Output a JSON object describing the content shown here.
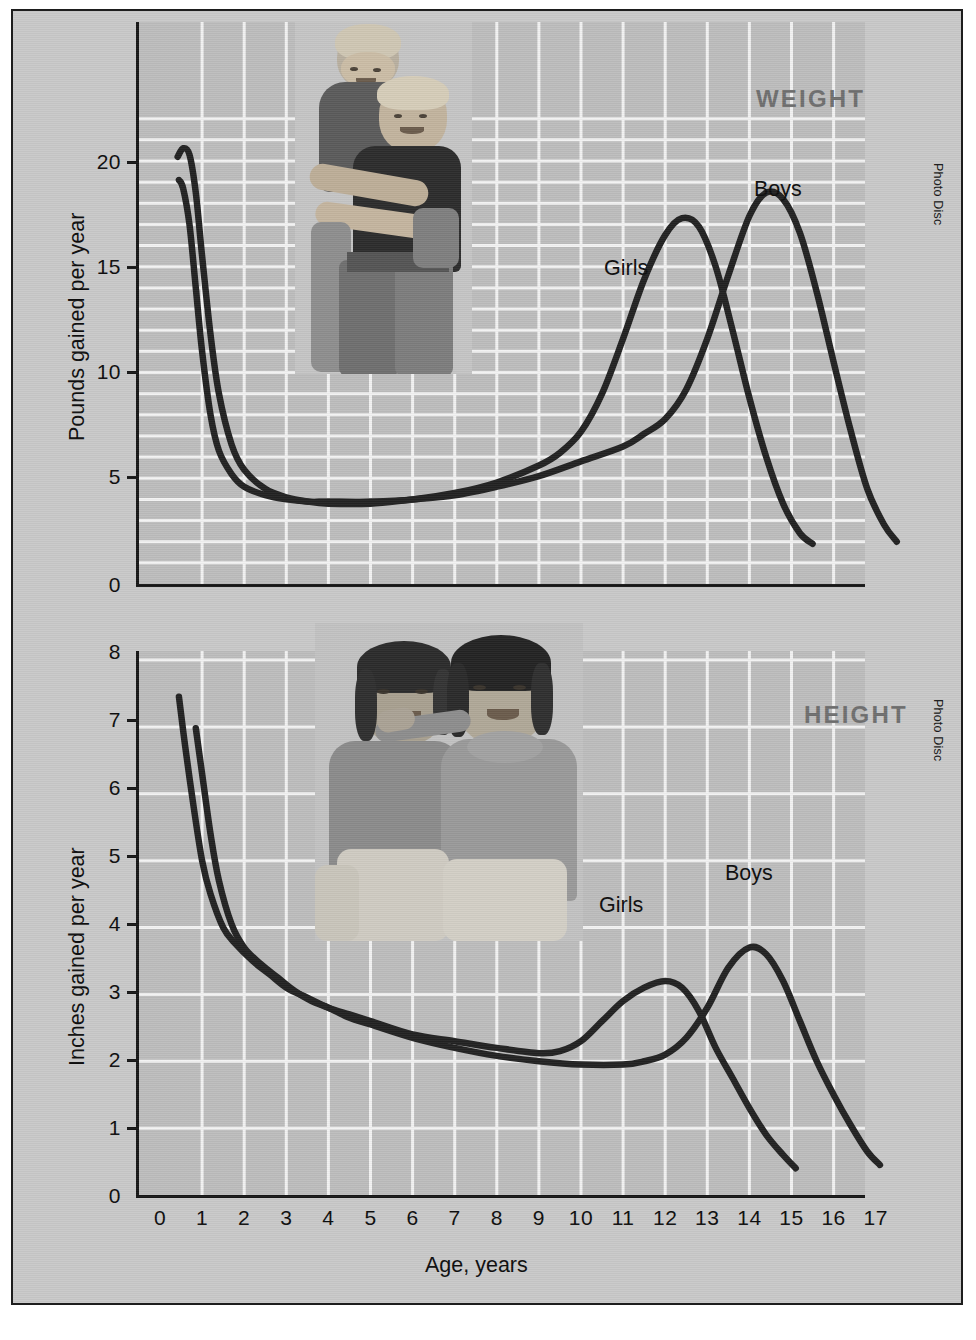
{
  "figure": {
    "background_color": "#c9c9c9",
    "plot_background_color": "#bdbdbd",
    "grid_color": "#f2f2f2",
    "curve_color": "#222222",
    "title_color": "#6f6f6f",
    "credit_weight": "Photo Disc",
    "credit_height": "Photo Disc"
  },
  "chart_data": [
    {
      "type": "line",
      "title": "WEIGHT",
      "xlabel": "Age, years",
      "ylabel": "Pounds gained per year",
      "xlim": [
        0,
        18
      ],
      "ylim": [
        0,
        23
      ],
      "xticks": [
        "0",
        "1",
        "2",
        "3",
        "4",
        "5",
        "6",
        "7",
        "8",
        "9",
        "10",
        "11",
        "12",
        "13",
        "14",
        "15",
        "16",
        "17"
      ],
      "yticks": [
        "0",
        "5",
        "10",
        "15",
        "20"
      ],
      "grid": true,
      "legend_position": "inline-annotation",
      "series": [
        {
          "name": "Girls",
          "label_x": 11.1,
          "label_y": 16.2,
          "points": [
            [
              0.45,
              19.1
            ],
            [
              0.55,
              18.7
            ],
            [
              0.7,
              17.0
            ],
            [
              0.85,
              14.0
            ],
            [
              1.0,
              11.0
            ],
            [
              1.2,
              8.0
            ],
            [
              1.4,
              6.3
            ],
            [
              1.7,
              5.2
            ],
            [
              2.0,
              4.6
            ],
            [
              2.5,
              4.2
            ],
            [
              3.0,
              4.0
            ],
            [
              3.5,
              3.9
            ],
            [
              4.0,
              3.9
            ],
            [
              5.0,
              3.9
            ],
            [
              6.0,
              4.0
            ],
            [
              7.0,
              4.3
            ],
            [
              8.0,
              4.8
            ],
            [
              9.0,
              5.6
            ],
            [
              9.5,
              6.2
            ],
            [
              10.0,
              7.2
            ],
            [
              10.5,
              9.0
            ],
            [
              11.0,
              11.6
            ],
            [
              11.5,
              14.4
            ],
            [
              12.0,
              16.5
            ],
            [
              12.4,
              17.3
            ],
            [
              12.8,
              16.9
            ],
            [
              13.2,
              15.0
            ],
            [
              13.6,
              12.0
            ],
            [
              14.0,
              8.8
            ],
            [
              14.4,
              6.0
            ],
            [
              14.8,
              3.8
            ],
            [
              15.2,
              2.4
            ],
            [
              15.5,
              1.9
            ]
          ]
        },
        {
          "name": "Boys",
          "label_x": 14.4,
          "label_y": 19.4,
          "points": [
            [
              0.42,
              20.2
            ],
            [
              0.55,
              20.6
            ],
            [
              0.7,
              20.3
            ],
            [
              0.85,
              18.5
            ],
            [
              1.0,
              15.5
            ],
            [
              1.2,
              11.8
            ],
            [
              1.4,
              9.0
            ],
            [
              1.7,
              6.6
            ],
            [
              2.0,
              5.4
            ],
            [
              2.5,
              4.5
            ],
            [
              3.0,
              4.1
            ],
            [
              3.5,
              3.9
            ],
            [
              4.0,
              3.8
            ],
            [
              5.0,
              3.8
            ],
            [
              6.0,
              4.0
            ],
            [
              7.0,
              4.2
            ],
            [
              8.0,
              4.6
            ],
            [
              9.0,
              5.1
            ],
            [
              10.0,
              5.8
            ],
            [
              11.0,
              6.5
            ],
            [
              11.5,
              7.1
            ],
            [
              12.0,
              7.8
            ],
            [
              12.5,
              9.2
            ],
            [
              13.0,
              11.6
            ],
            [
              13.5,
              14.6
            ],
            [
              14.0,
              17.4
            ],
            [
              14.4,
              18.5
            ],
            [
              14.8,
              18.2
            ],
            [
              15.2,
              16.6
            ],
            [
              15.6,
              13.8
            ],
            [
              16.0,
              10.5
            ],
            [
              16.4,
              7.3
            ],
            [
              16.8,
              4.5
            ],
            [
              17.2,
              2.8
            ],
            [
              17.5,
              2.0
            ]
          ]
        }
      ]
    },
    {
      "type": "line",
      "title": "HEIGHT",
      "xlabel": "Age, years",
      "ylabel": "Inches gained per year",
      "xlim": [
        0,
        18
      ],
      "ylim": [
        0,
        8
      ],
      "xticks": [
        "0",
        "1",
        "2",
        "3",
        "4",
        "5",
        "6",
        "7",
        "8",
        "9",
        "10",
        "11",
        "12",
        "13",
        "14",
        "15",
        "16",
        "17"
      ],
      "yticks": [
        "0",
        "1",
        "2",
        "3",
        "4",
        "5",
        "6",
        "7",
        "8"
      ],
      "grid": true,
      "legend_position": "inline-annotation",
      "series": [
        {
          "name": "Girls",
          "label_x": 11.0,
          "label_y": 3.72,
          "points": [
            [
              0.45,
              7.45
            ],
            [
              0.6,
              6.7
            ],
            [
              0.8,
              5.8
            ],
            [
              1.0,
              5.0
            ],
            [
              1.2,
              4.5
            ],
            [
              1.5,
              4.0
            ],
            [
              1.8,
              3.75
            ],
            [
              2.2,
              3.5
            ],
            [
              2.6,
              3.3
            ],
            [
              3.0,
              3.1
            ],
            [
              3.5,
              2.95
            ],
            [
              4.0,
              2.8
            ],
            [
              4.5,
              2.7
            ],
            [
              5.0,
              2.6
            ],
            [
              6.0,
              2.4
            ],
            [
              7.0,
              2.3
            ],
            [
              8.0,
              2.2
            ],
            [
              9.0,
              2.12
            ],
            [
              9.5,
              2.15
            ],
            [
              10.0,
              2.3
            ],
            [
              10.5,
              2.6
            ],
            [
              11.0,
              2.9
            ],
            [
              11.5,
              3.1
            ],
            [
              12.0,
              3.2
            ],
            [
              12.4,
              3.1
            ],
            [
              12.8,
              2.75
            ],
            [
              13.2,
              2.2
            ],
            [
              13.6,
              1.75
            ],
            [
              14.0,
              1.3
            ],
            [
              14.4,
              0.9
            ],
            [
              14.8,
              0.6
            ],
            [
              15.1,
              0.4
            ]
          ]
        },
        {
          "name": "Boys",
          "label_x": 14.0,
          "label_y": 4.2,
          "points": [
            [
              0.85,
              6.98
            ],
            [
              1.0,
              6.3
            ],
            [
              1.2,
              5.4
            ],
            [
              1.4,
              4.7
            ],
            [
              1.7,
              4.05
            ],
            [
              2.0,
              3.7
            ],
            [
              2.4,
              3.45
            ],
            [
              2.8,
              3.25
            ],
            [
              3.2,
              3.05
            ],
            [
              3.6,
              2.9
            ],
            [
              4.0,
              2.8
            ],
            [
              4.5,
              2.65
            ],
            [
              5.0,
              2.55
            ],
            [
              6.0,
              2.35
            ],
            [
              7.0,
              2.2
            ],
            [
              8.0,
              2.08
            ],
            [
              9.0,
              2.0
            ],
            [
              10.0,
              1.95
            ],
            [
              11.0,
              1.95
            ],
            [
              11.5,
              2.0
            ],
            [
              12.0,
              2.1
            ],
            [
              12.5,
              2.35
            ],
            [
              13.0,
              2.8
            ],
            [
              13.5,
              3.4
            ],
            [
              14.0,
              3.7
            ],
            [
              14.4,
              3.6
            ],
            [
              14.8,
              3.2
            ],
            [
              15.2,
              2.6
            ],
            [
              15.6,
              2.0
            ],
            [
              16.0,
              1.5
            ],
            [
              16.4,
              1.05
            ],
            [
              16.8,
              0.65
            ],
            [
              17.1,
              0.45
            ]
          ]
        }
      ]
    }
  ]
}
